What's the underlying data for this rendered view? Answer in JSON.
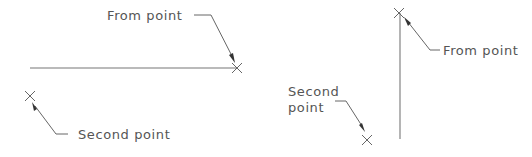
{
  "diagram": {
    "left_example": {
      "line": {
        "x1": 30,
        "y1": 68,
        "x2": 237,
        "y2": 68,
        "orientation": "horizontal"
      },
      "from_point": {
        "label": "From point",
        "marker": {
          "x": 237,
          "y": 68
        },
        "text_pos": {
          "x": 107,
          "y": 20
        }
      },
      "second_point": {
        "label": "Second point",
        "marker": {
          "x": 30,
          "y": 96
        },
        "text_pos": {
          "x": 78,
          "y": 139
        }
      }
    },
    "right_example": {
      "line": {
        "x1": 400,
        "y1": 12,
        "x2": 400,
        "y2": 139,
        "orientation": "vertical"
      },
      "from_point": {
        "label": "From point",
        "marker": {
          "x": 399,
          "y": 13
        },
        "text_pos": {
          "x": 443,
          "y": 55
        }
      },
      "second_point": {
        "label_line1": "Second",
        "label_line2": "point",
        "marker": {
          "x": 367,
          "y": 140
        },
        "text_pos": {
          "x": 288,
          "y": 96
        }
      }
    },
    "colors": {
      "background": "#ffffff",
      "line": "#777777",
      "text": "#555555",
      "arrowhead": "#333333"
    }
  }
}
